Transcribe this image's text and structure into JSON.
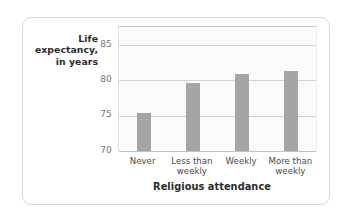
{
  "chart_data": {
    "type": "bar",
    "title": "",
    "subtitle": "",
    "xlabel": "Religious attendance",
    "ylabel": "Life expectancy, in years",
    "ylabel_lines": [
      "Life",
      "expectancy,",
      "in years"
    ],
    "categories": [
      "Never",
      "Less than weekly",
      "Weekly",
      "More than weekly"
    ],
    "category_lines": [
      [
        "Never"
      ],
      [
        "Less than",
        "weekly"
      ],
      [
        "Weekly"
      ],
      [
        "More than",
        "weekly"
      ]
    ],
    "values": [
      75.3,
      79.6,
      80.8,
      81.3
    ],
    "ylim": [
      70,
      87.5
    ],
    "yticks": [
      70,
      75,
      80,
      85
    ],
    "ytick_labels": [
      "70",
      "75",
      "80",
      "85"
    ],
    "grid": true,
    "grid_axis": "y",
    "legend": false,
    "legend_position": "none",
    "bar_color": "#a5a5a5",
    "plot_background": "#fbfbfb",
    "gridline_color": "#d2d2d2",
    "card_border_color": "#d9d9d9"
  }
}
